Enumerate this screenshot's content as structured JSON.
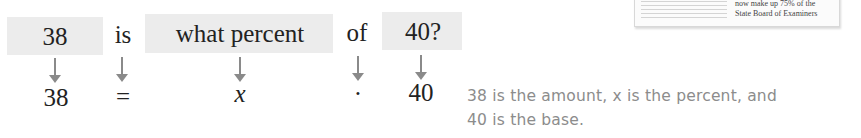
{
  "top_row": {
    "amount": "38",
    "is": "is",
    "what_percent": "what percent",
    "of": "of",
    "base": "40?"
  },
  "bottom_row": {
    "amount": "38",
    "equals": "=",
    "variable": "x",
    "times": "·",
    "base": "40"
  },
  "note": {
    "line1": "38 is the amount, x is the percent, and",
    "line2": "40 is the base."
  },
  "clipping": {
    "line1": "now make up 75% of the",
    "line2": "State Board of Examiners"
  },
  "colors": {
    "box_fill": "#ececec",
    "arrow": "#8a8a8a",
    "note_text": "#8c8c8c"
  }
}
